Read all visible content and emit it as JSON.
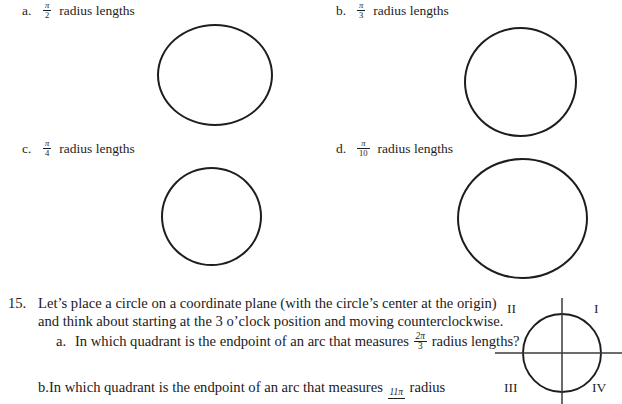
{
  "document": {
    "background_color": "#ffffff",
    "ink_color": "#1e1e1e"
  },
  "options": [
    {
      "letter": "a.",
      "numerator": "π",
      "denominator": "2",
      "text": "radius lengths"
    },
    {
      "letter": "b.",
      "numerator": "π",
      "denominator": "3",
      "text": "radius lengths"
    },
    {
      "letter": "c.",
      "numerator": "π",
      "denominator": "4",
      "text": "radius lengths"
    },
    {
      "letter": "d.",
      "numerator": "π",
      "denominator": "10",
      "text": "radius lengths"
    }
  ],
  "question15": {
    "number": "15.",
    "line1": "Let’s place a circle on a coordinate plane (with the circle’s center at the origin)",
    "line2": "and think about starting at the 3 o’clock position and moving counterclockwise.",
    "sub_a": {
      "letter": "a.",
      "text_before": "In which quadrant is the endpoint of an arc that measures",
      "numerator": "2π",
      "denominator": "3",
      "text_after": "radius lengths?"
    },
    "sub_b": {
      "letter": "b.",
      "text_before": "In which quadrant is the endpoint of an arc that measures",
      "numerator": "11π",
      "denominator": "",
      "text_after": "radius"
    }
  },
  "quadrant_diagram": {
    "labels": {
      "quadrant_i": "I",
      "quadrant_ii": "II",
      "quadrant_iii": "III",
      "quadrant_iv": "IV"
    }
  }
}
